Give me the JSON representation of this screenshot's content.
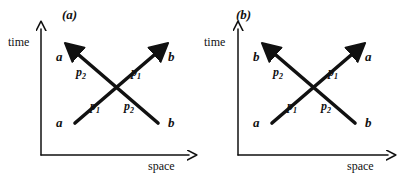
{
  "figure": {
    "line_color": "#111111",
    "axis_color": "#111111",
    "background_color": "#ffffff"
  },
  "panels": [
    {
      "id": "a",
      "title": "(a)",
      "axes": {
        "vertical_label": "time",
        "horizontal_label": "space"
      },
      "incoming": [
        {
          "position": "bottom-left",
          "particle": "a",
          "momentum_symbol": "p",
          "momentum_index": "1"
        },
        {
          "position": "bottom-right",
          "particle": "b",
          "momentum_symbol": "p",
          "momentum_index": "2"
        }
      ],
      "outgoing": [
        {
          "position": "top-left",
          "particle": "a",
          "momentum_symbol": "p",
          "momentum_index": "2"
        },
        {
          "position": "top-right",
          "particle": "b",
          "momentum_symbol": "p",
          "momentum_index": "1"
        }
      ]
    },
    {
      "id": "b",
      "title": "(b)",
      "axes": {
        "vertical_label": "time",
        "horizontal_label": "space"
      },
      "incoming": [
        {
          "position": "bottom-left",
          "particle": "a",
          "momentum_symbol": "p",
          "momentum_index": "1"
        },
        {
          "position": "bottom-right",
          "particle": "b",
          "momentum_symbol": "p",
          "momentum_index": "2"
        }
      ],
      "outgoing": [
        {
          "position": "top-left",
          "particle": "b",
          "momentum_symbol": "p",
          "momentum_index": "2"
        },
        {
          "position": "top-right",
          "particle": "a",
          "momentum_symbol": "p",
          "momentum_index": "1"
        }
      ]
    }
  ]
}
